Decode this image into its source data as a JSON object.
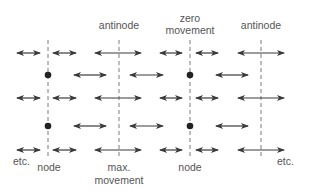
{
  "diagram": {
    "colors": {
      "arrow": "#3a3a3a",
      "dashed_line": "#7a7a7a",
      "node_dot": "#222222",
      "label": "#555555",
      "background": "#ffffff"
    },
    "labels": {
      "top_antinode_1": "antinode",
      "top_zero_movement": "zero movement",
      "top_zero_line1": "zero",
      "top_zero_line2": "movement",
      "top_antinode_2": "antinode",
      "bottom_etc_left": "etc.",
      "bottom_node_1": "node",
      "bottom_max_line1": "max.",
      "bottom_max_line2": "movement",
      "bottom_node_2": "node",
      "bottom_etc_right": "etc."
    },
    "vertical_lines": [
      {
        "x": 48,
        "kind": "node"
      },
      {
        "x": 119,
        "kind": "antinode"
      },
      {
        "x": 190,
        "kind": "node"
      },
      {
        "x": 261,
        "kind": "antinode"
      }
    ],
    "rows": [
      {
        "y": 53,
        "type": "antinode-row",
        "arrows": [
          [
            17,
            40
          ],
          [
            53,
            76
          ],
          [
            95,
            141
          ],
          [
            160,
            182
          ],
          [
            196,
            218
          ],
          [
            238,
            284
          ]
        ],
        "dots": []
      },
      {
        "y": 75,
        "type": "node-row",
        "arrows": [
          [
            74,
            106
          ],
          [
            130,
            163
          ],
          [
            216,
            248
          ]
        ],
        "dots": [
          48,
          190
        ]
      },
      {
        "y": 98,
        "type": "antinode-row",
        "arrows": [
          [
            17,
            40
          ],
          [
            53,
            76
          ],
          [
            95,
            141
          ],
          [
            160,
            182
          ],
          [
            196,
            218
          ],
          [
            238,
            284
          ]
        ],
        "dots": []
      },
      {
        "y": 126,
        "type": "node-row",
        "arrows": [
          [
            74,
            106
          ],
          [
            130,
            163
          ],
          [
            216,
            248
          ]
        ],
        "dots": [
          48,
          190
        ]
      },
      {
        "y": 150,
        "type": "antinode-row",
        "arrows": [
          [
            17,
            40
          ],
          [
            53,
            76
          ],
          [
            95,
            141
          ],
          [
            160,
            182
          ],
          [
            196,
            218
          ],
          [
            238,
            284
          ]
        ],
        "dots": []
      }
    ]
  }
}
